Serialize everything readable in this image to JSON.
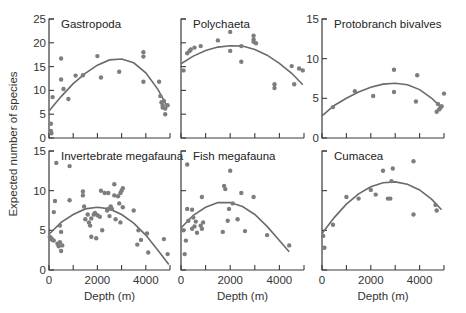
{
  "figure": {
    "shared_ylabel": "Expected number of species",
    "shared_xlabel": "Depth (m)"
  },
  "chart_data": [
    {
      "type": "scatter",
      "title": "Gastropoda",
      "xlabel": "",
      "ylabel": "Expected number of species",
      "xlim": [
        0,
        5000
      ],
      "ylim": [
        0,
        25
      ],
      "yticks": [
        0,
        5,
        10,
        15,
        20,
        25
      ],
      "xticks": [
        0,
        1000,
        2000,
        3000,
        4000,
        5000
      ],
      "show_xticklabels": false,
      "show_yticklabels": true,
      "points": [
        [
          80,
          3
        ],
        [
          80,
          1.5
        ],
        [
          100,
          1
        ],
        [
          150,
          8.6
        ],
        [
          500,
          16.7
        ],
        [
          500,
          12.3
        ],
        [
          600,
          10.3
        ],
        [
          800,
          8.2
        ],
        [
          1100,
          13.1
        ],
        [
          1400,
          13.2
        ],
        [
          2000,
          17.2
        ],
        [
          2150,
          12.7
        ],
        [
          2900,
          13.9
        ],
        [
          3900,
          18.0
        ],
        [
          3900,
          17.1
        ],
        [
          3900,
          11.8
        ],
        [
          4550,
          11.8
        ],
        [
          4600,
          8.8
        ],
        [
          4650,
          7.5
        ],
        [
          4700,
          6.9
        ],
        [
          4700,
          6.4
        ],
        [
          4750,
          7.8
        ],
        [
          4800,
          6.2
        ],
        [
          4800,
          5.0
        ],
        [
          4900,
          6.9
        ]
      ],
      "fit_curve": {
        "type": "quadratic",
        "x": [
          0,
          500,
          1000,
          1500,
          2000,
          2500,
          3000,
          3500,
          4000,
          4500,
          4900
        ],
        "y": [
          5.7,
          8.7,
          11.4,
          13.6,
          15.3,
          16.4,
          16.6,
          15.8,
          13.7,
          10.2,
          6.5
        ]
      }
    },
    {
      "type": "scatter",
      "title": "Polychaeta",
      "xlabel": "",
      "ylabel": "",
      "xlim": [
        0,
        5000
      ],
      "ylim": [
        0,
        25
      ],
      "yticks": [
        0,
        5,
        10,
        15,
        20,
        25
      ],
      "xticks": [
        0,
        1000,
        2000,
        3000,
        4000,
        5000
      ],
      "show_xticklabels": false,
      "show_yticklabels": false,
      "points": [
        [
          100,
          14.2
        ],
        [
          250,
          17.8
        ],
        [
          350,
          18.3
        ],
        [
          400,
          18.6
        ],
        [
          550,
          19.0
        ],
        [
          800,
          19.3
        ],
        [
          1500,
          20.5
        ],
        [
          2000,
          18.3
        ],
        [
          2000,
          22.3
        ],
        [
          2450,
          19.3
        ],
        [
          2450,
          16.0
        ],
        [
          2950,
          21.5
        ],
        [
          2950,
          20.7
        ],
        [
          2950,
          20.2
        ],
        [
          3050,
          19.9
        ],
        [
          3800,
          11.3
        ],
        [
          3800,
          10.5
        ],
        [
          4500,
          15.1
        ],
        [
          4600,
          11.3
        ],
        [
          4800,
          14.6
        ],
        [
          4950,
          14.2
        ]
      ],
      "fit_curve": {
        "type": "quadratic",
        "x": [
          0,
          500,
          1000,
          1500,
          2000,
          2500,
          3000,
          3500,
          4000,
          4500,
          4950
        ],
        "y": [
          15.6,
          17.2,
          18.4,
          19.1,
          19.4,
          19.3,
          18.6,
          17.4,
          15.7,
          13.6,
          11.2
        ]
      }
    },
    {
      "type": "scatter",
      "title": "Protobranch bivalves",
      "xlabel": "",
      "ylabel": "",
      "xlim": [
        0,
        5000
      ],
      "ylim": [
        0,
        15
      ],
      "yticks": [
        0,
        5,
        10,
        15
      ],
      "xticks": [
        0,
        1000,
        2000,
        3000,
        4000,
        5000
      ],
      "show_xticklabels": false,
      "show_yticklabels": true,
      "points": [
        [
          450,
          3.9
        ],
        [
          1350,
          5.9
        ],
        [
          2100,
          5.3
        ],
        [
          2950,
          8.6
        ],
        [
          2950,
          5.8
        ],
        [
          3850,
          4.6
        ],
        [
          3900,
          7.9
        ],
        [
          4700,
          3.3
        ],
        [
          4750,
          4.3
        ],
        [
          4800,
          3.6
        ],
        [
          4850,
          3.8
        ],
        [
          4900,
          4.0
        ],
        [
          5000,
          5.6
        ]
      ],
      "fit_curve": {
        "type": "quadratic",
        "x": [
          0,
          500,
          1000,
          1500,
          2000,
          2500,
          3000,
          3500,
          4000,
          4500,
          4900
        ],
        "y": [
          2.8,
          4.1,
          5.0,
          5.8,
          6.4,
          6.8,
          6.9,
          6.7,
          6.1,
          5.0,
          3.8
        ]
      }
    },
    {
      "type": "scatter",
      "title": "Invertebrate megafauna",
      "xlabel": "Depth (m)",
      "ylabel": "Expected number of species",
      "xlim": [
        0,
        5000
      ],
      "ylim": [
        0,
        15
      ],
      "yticks": [
        0,
        5,
        10,
        15
      ],
      "xticks": [
        0,
        1000,
        2000,
        3000,
        4000,
        5000
      ],
      "xticklabels": [
        "0",
        "2000",
        "4000"
      ],
      "show_xticklabels": true,
      "show_yticklabels": true,
      "points": [
        [
          30,
          4.2
        ],
        [
          60,
          3.9
        ],
        [
          100,
          4.0
        ],
        [
          150,
          3.8
        ],
        [
          200,
          3.7
        ],
        [
          200,
          7.3
        ],
        [
          250,
          8.7
        ],
        [
          350,
          3.3
        ],
        [
          400,
          3.0
        ],
        [
          450,
          5.6
        ],
        [
          450,
          3.5
        ],
        [
          500,
          4.8
        ],
        [
          500,
          2.4
        ],
        [
          550,
          3.1
        ],
        [
          300,
          13.5
        ],
        [
          850,
          13.1
        ],
        [
          850,
          8.8
        ],
        [
          1400,
          9.9
        ],
        [
          1400,
          9.4
        ],
        [
          1450,
          8.0
        ],
        [
          1500,
          6.4
        ],
        [
          1600,
          7.0
        ],
        [
          1650,
          6.0
        ],
        [
          1700,
          5.6
        ],
        [
          1750,
          6.5
        ],
        [
          1750,
          4.2
        ],
        [
          1850,
          7.0
        ],
        [
          1900,
          7.2
        ],
        [
          2000,
          6.9
        ],
        [
          1950,
          4.0
        ],
        [
          2100,
          6.7
        ],
        [
          2150,
          10.0
        ],
        [
          2200,
          5.0
        ],
        [
          2300,
          9.7
        ],
        [
          2400,
          7.5
        ],
        [
          2450,
          9.7
        ],
        [
          2450,
          7.7
        ],
        [
          2500,
          6.8
        ],
        [
          2550,
          8.0
        ],
        [
          2600,
          7.7
        ],
        [
          2700,
          10.8
        ],
        [
          2700,
          9.4
        ],
        [
          2750,
          6.4
        ],
        [
          2850,
          9.3
        ],
        [
          2900,
          8.4
        ],
        [
          2950,
          9.7
        ],
        [
          2950,
          6.0
        ],
        [
          3000,
          10.0
        ],
        [
          3050,
          10.3
        ],
        [
          3050,
          7.9
        ],
        [
          3500,
          7.5
        ],
        [
          3650,
          3.2
        ],
        [
          3700,
          5.0
        ],
        [
          3800,
          3.8
        ],
        [
          4050,
          4.6
        ],
        [
          4100,
          2.2
        ],
        [
          4750,
          3.9
        ],
        [
          4900,
          2.0
        ]
      ],
      "fit_curve": {
        "type": "quadratic",
        "x": [
          0,
          500,
          1000,
          1500,
          2000,
          2500,
          3000,
          3500,
          4000,
          4500,
          4950
        ],
        "y": [
          4.5,
          6.0,
          7.0,
          7.7,
          7.9,
          7.7,
          7.0,
          5.9,
          4.4,
          2.5,
          0.7
        ]
      }
    },
    {
      "type": "scatter",
      "title": "Fish megafauna",
      "xlabel": "Depth (m)",
      "ylabel": "",
      "xlim": [
        0,
        5000
      ],
      "ylim": [
        0,
        15
      ],
      "yticks": [
        0,
        5,
        10,
        15
      ],
      "xticks": [
        0,
        1000,
        2000,
        3000,
        4000,
        5000
      ],
      "xticklabels": [
        "0",
        "2000",
        "4000"
      ],
      "show_xticklabels": true,
      "show_yticklabels": false,
      "points": [
        [
          100,
          5.0
        ],
        [
          150,
          2.0
        ],
        [
          200,
          3.7
        ],
        [
          250,
          13.3
        ],
        [
          250,
          7.7
        ],
        [
          300,
          6.2
        ],
        [
          450,
          7.6
        ],
        [
          450,
          5.2
        ],
        [
          500,
          6.6
        ],
        [
          550,
          5.5
        ],
        [
          600,
          6.1
        ],
        [
          650,
          4.7
        ],
        [
          800,
          5.6
        ],
        [
          850,
          9.2
        ],
        [
          850,
          5.2
        ],
        [
          900,
          6.0
        ],
        [
          1700,
          4.8
        ],
        [
          1750,
          10.6
        ],
        [
          1800,
          10.2
        ],
        [
          1900,
          6.2
        ],
        [
          1950,
          7.7
        ],
        [
          2000,
          12.5
        ],
        [
          2100,
          8.4
        ],
        [
          2300,
          6.4
        ],
        [
          2450,
          9.7
        ],
        [
          2600,
          4.9
        ],
        [
          2950,
          9.2
        ],
        [
          3500,
          4.4
        ],
        [
          4400,
          3.1
        ]
      ],
      "fit_curve": {
        "type": "quadratic",
        "x": [
          0,
          500,
          1000,
          1500,
          2000,
          2500,
          3000,
          3500,
          4000,
          4400
        ],
        "y": [
          5.3,
          6.9,
          7.9,
          8.5,
          8.5,
          8.0,
          7.0,
          5.5,
          3.7,
          2.3
        ]
      }
    },
    {
      "type": "scatter",
      "title": "Cumacea",
      "xlabel": "Depth (m)",
      "ylabel": "",
      "xlim": [
        0,
        5000
      ],
      "ylim": [
        0,
        15
      ],
      "yticks": [
        0,
        5,
        10,
        15
      ],
      "xticks": [
        0,
        1000,
        2000,
        3000,
        4000,
        5000
      ],
      "xticklabels": [
        "0",
        "2000",
        "4000"
      ],
      "show_xticklabels": true,
      "show_yticklabels": false,
      "points": [
        [
          50,
          4.3
        ],
        [
          100,
          2.8
        ],
        [
          450,
          5.7
        ],
        [
          1000,
          9.2
        ],
        [
          1500,
          9.0
        ],
        [
          2000,
          10.1
        ],
        [
          2200,
          9.5
        ],
        [
          2500,
          12.5
        ],
        [
          2700,
          9.0
        ],
        [
          2800,
          9.0
        ],
        [
          2850,
          11.2
        ],
        [
          2900,
          12.8
        ],
        [
          3750,
          13.7
        ],
        [
          3750,
          7.0
        ],
        [
          4650,
          8.2
        ],
        [
          4700,
          7.5
        ]
      ],
      "fit_curve": {
        "type": "quadratic",
        "x": [
          0,
          500,
          1000,
          1500,
          2000,
          2500,
          3000,
          3500,
          4000,
          4500,
          4900
        ],
        "y": [
          4.6,
          6.6,
          8.3,
          9.6,
          10.5,
          11.0,
          11.1,
          10.8,
          10.1,
          8.9,
          7.6
        ]
      }
    }
  ]
}
